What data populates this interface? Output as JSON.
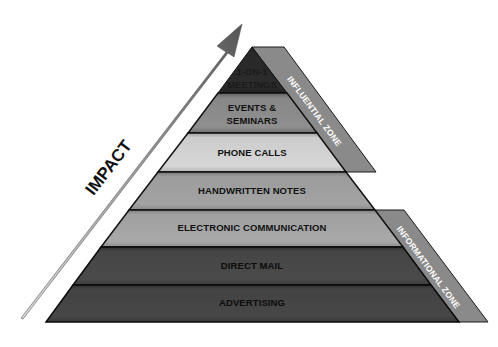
{
  "diagram": {
    "type": "pyramid",
    "axis_label": "IMPACT",
    "layers": [
      {
        "label_line1": "1-ON-1",
        "label_line2": "MEETINGS",
        "color": "#2b2b2b"
      },
      {
        "label_line1": "EVENTS &",
        "label_line2": "SEMINARS",
        "color": "#8f8f8f"
      },
      {
        "label": "PHONE CALLS",
        "color": "#d6d6d6"
      },
      {
        "label": "HANDWRITTEN NOTES",
        "color": "#a3a3a3"
      },
      {
        "label": "ELECTRONIC COMMUNICATION",
        "color": "#a8a8a8"
      },
      {
        "label": "DIRECT MAIL",
        "color": "#4a4a4a"
      },
      {
        "label": "ADVERTISING",
        "color": "#474747"
      }
    ],
    "zones": [
      {
        "label": "INFLUENTIAL ZONE",
        "color": "#8a8a8a"
      },
      {
        "label": "INFORMATIONAL ZONE",
        "color": "#8a8a8a"
      }
    ]
  }
}
